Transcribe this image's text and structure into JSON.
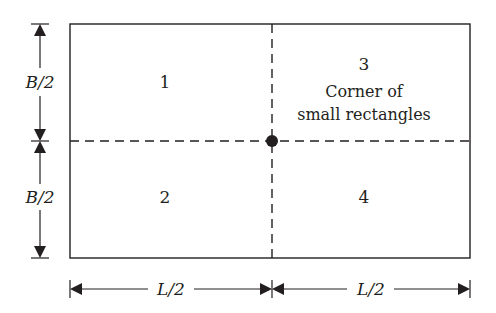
{
  "diagram": {
    "regions": [
      {
        "id": "1",
        "label": "1"
      },
      {
        "id": "2",
        "label": "2"
      },
      {
        "id": "3",
        "label": "3",
        "note_line1": "Corner of",
        "note_line2": "small rectangles"
      },
      {
        "id": "4",
        "label": "4"
      }
    ],
    "dimensions": {
      "vertical_top": "B/2",
      "vertical_bottom": "B/2",
      "horizontal_left": "L/2",
      "horizontal_right": "L/2"
    },
    "colors": {
      "stroke": "#231f20",
      "background": "#ffffff"
    }
  }
}
